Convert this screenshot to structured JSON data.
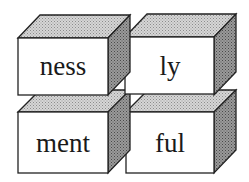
{
  "diagram": {
    "blocks": [
      {
        "label": "ness",
        "position": "top-left"
      },
      {
        "label": "ly",
        "position": "top-right"
      },
      {
        "label": "ment",
        "position": "bottom-left"
      },
      {
        "label": "ful",
        "position": "bottom-right"
      }
    ],
    "colors": {
      "front_face": "#ffffff",
      "top_face": "#c8c8c8",
      "side_face": "#8a8a8a",
      "stroke": "#222222"
    }
  }
}
